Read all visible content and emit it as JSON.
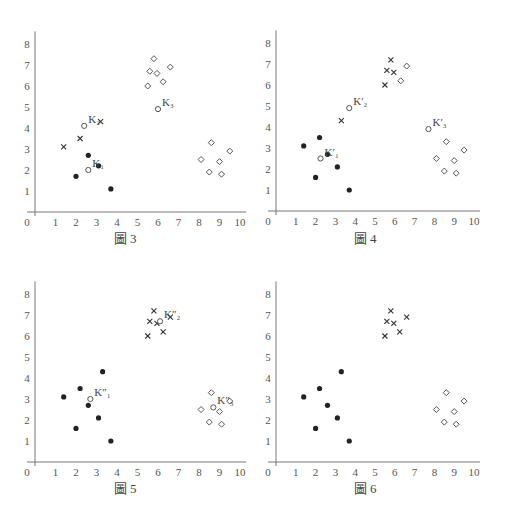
{
  "chart_data": [
    {
      "type": "scatter",
      "title": "圖 3",
      "xlabel": "",
      "ylabel": "",
      "xlim": [
        0,
        10
      ],
      "ylim": [
        0,
        8
      ],
      "xticks": [
        0,
        1,
        2,
        3,
        4,
        5,
        6,
        7,
        8,
        9,
        10
      ],
      "yticks": [
        1,
        2,
        3,
        4,
        5,
        6,
        7,
        8
      ],
      "series": [
        {
          "name": "dot",
          "marker": "filled-circle",
          "points": [
            [
              2.0,
              1.7
            ],
            [
              2.6,
              2.7
            ],
            [
              3.1,
              2.2
            ],
            [
              3.7,
              1.1
            ]
          ]
        },
        {
          "name": "cross",
          "marker": "x",
          "points": [
            [
              1.4,
              3.1
            ],
            [
              2.2,
              3.5
            ],
            [
              3.2,
              4.3
            ]
          ]
        },
        {
          "name": "diamond",
          "marker": "diamond",
          "points": [
            [
              5.5,
              6.0
            ],
            [
              5.6,
              6.7
            ],
            [
              5.8,
              7.3
            ],
            [
              5.95,
              6.6
            ],
            [
              6.25,
              6.2
            ],
            [
              6.6,
              6.9
            ],
            [
              8.1,
              2.5
            ],
            [
              8.5,
              1.9
            ],
            [
              8.6,
              3.3
            ],
            [
              9.0,
              2.4
            ],
            [
              9.1,
              1.8
            ],
            [
              9.5,
              2.9
            ]
          ]
        },
        {
          "name": "centroid",
          "marker": "open-circle",
          "points": [
            [
              2.6,
              2.0
            ],
            [
              2.4,
              4.1
            ],
            [
              6.0,
              4.9
            ]
          ],
          "labels": [
            "K₁",
            "K₂",
            "K₃"
          ]
        }
      ]
    },
    {
      "type": "scatter",
      "title": "圖 4",
      "xlim": [
        0,
        10
      ],
      "ylim": [
        0,
        8
      ],
      "xticks": [
        0,
        1,
        2,
        3,
        4,
        5,
        6,
        7,
        8,
        9,
        10
      ],
      "yticks": [
        1,
        2,
        3,
        4,
        5,
        6,
        7,
        8
      ],
      "series": [
        {
          "name": "dot",
          "marker": "filled-circle",
          "points": [
            [
              1.4,
              3.1
            ],
            [
              2.0,
              1.6
            ],
            [
              2.2,
              3.5
            ],
            [
              2.6,
              2.7
            ],
            [
              3.1,
              2.1
            ],
            [
              3.7,
              1.0
            ]
          ]
        },
        {
          "name": "cross",
          "marker": "x",
          "points": [
            [
              3.3,
              4.3
            ],
            [
              5.5,
              6.0
            ],
            [
              5.6,
              6.7
            ],
            [
              5.8,
              7.2
            ],
            [
              5.95,
              6.6
            ]
          ]
        },
        {
          "name": "diamond",
          "marker": "diamond",
          "points": [
            [
              6.3,
              6.2
            ],
            [
              6.6,
              6.9
            ],
            [
              8.1,
              2.5
            ],
            [
              8.5,
              1.9
            ],
            [
              8.6,
              3.3
            ],
            [
              9.0,
              2.4
            ],
            [
              9.1,
              1.8
            ],
            [
              9.5,
              2.9
            ]
          ]
        },
        {
          "name": "centroid",
          "marker": "open-circle",
          "points": [
            [
              2.25,
              2.5
            ],
            [
              3.7,
              4.9
            ],
            [
              7.7,
              3.9
            ]
          ],
          "labels": [
            "K′₁",
            "K′₂",
            "K′₃"
          ]
        }
      ]
    },
    {
      "type": "scatter",
      "title": "圖 5",
      "xlim": [
        0,
        10
      ],
      "ylim": [
        0,
        8
      ],
      "xticks": [
        0,
        1,
        2,
        3,
        4,
        5,
        6,
        7,
        8,
        9,
        10
      ],
      "yticks": [
        1,
        2,
        3,
        4,
        5,
        6,
        7,
        8
      ],
      "series": [
        {
          "name": "dot",
          "marker": "filled-circle",
          "points": [
            [
              1.4,
              3.1
            ],
            [
              2.0,
              1.6
            ],
            [
              2.2,
              3.5
            ],
            [
              2.6,
              2.7
            ],
            [
              3.1,
              2.1
            ],
            [
              3.3,
              4.3
            ],
            [
              3.7,
              1.0
            ]
          ]
        },
        {
          "name": "cross",
          "marker": "x",
          "points": [
            [
              5.5,
              6.0
            ],
            [
              5.6,
              6.7
            ],
            [
              5.8,
              7.2
            ],
            [
              5.95,
              6.6
            ],
            [
              6.25,
              6.2
            ],
            [
              6.6,
              6.9
            ]
          ]
        },
        {
          "name": "diamond",
          "marker": "diamond",
          "points": [
            [
              8.1,
              2.5
            ],
            [
              8.5,
              1.9
            ],
            [
              8.6,
              3.3
            ],
            [
              9.0,
              2.4
            ],
            [
              9.1,
              1.8
            ],
            [
              9.5,
              2.9
            ]
          ]
        },
        {
          "name": "centroid",
          "marker": "open-circle",
          "points": [
            [
              2.7,
              3.0
            ],
            [
              6.1,
              6.7
            ],
            [
              8.7,
              2.6
            ]
          ],
          "labels": [
            "K″₁",
            "K″₂",
            "K″₃"
          ]
        }
      ]
    },
    {
      "type": "scatter",
      "title": "圖 6",
      "xlim": [
        0,
        10
      ],
      "ylim": [
        0,
        8
      ],
      "xticks": [
        0,
        1,
        2,
        3,
        4,
        5,
        6,
        7,
        8,
        9,
        10
      ],
      "yticks": [
        1,
        2,
        3,
        4,
        5,
        6,
        7,
        8
      ],
      "series": [
        {
          "name": "dot",
          "marker": "filled-circle",
          "points": [
            [
              1.4,
              3.1
            ],
            [
              2.0,
              1.6
            ],
            [
              2.2,
              3.5
            ],
            [
              2.6,
              2.7
            ],
            [
              3.1,
              2.1
            ],
            [
              3.3,
              4.3
            ],
            [
              3.7,
              1.0
            ]
          ]
        },
        {
          "name": "cross",
          "marker": "x",
          "points": [
            [
              5.5,
              6.0
            ],
            [
              5.6,
              6.7
            ],
            [
              5.8,
              7.2
            ],
            [
              5.95,
              6.6
            ],
            [
              6.25,
              6.2
            ],
            [
              6.6,
              6.9
            ]
          ]
        },
        {
          "name": "diamond",
          "marker": "diamond",
          "points": [
            [
              8.1,
              2.5
            ],
            [
              8.5,
              1.9
            ],
            [
              8.6,
              3.3
            ],
            [
              9.0,
              2.4
            ],
            [
              9.1,
              1.8
            ],
            [
              9.5,
              2.9
            ]
          ]
        }
      ]
    }
  ],
  "captions": [
    "圖 3",
    "圖 4",
    "圖 5",
    "圖 6"
  ]
}
